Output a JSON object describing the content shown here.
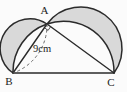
{
  "figure": {
    "labels": {
      "vertex_a": "A",
      "vertex_b": "B",
      "vertex_c": "C",
      "measurement": "9cm"
    },
    "colors": {
      "background": "#fbfbfb",
      "line": "#2b2b2b",
      "shade": "#d9d9d9",
      "dashed_line": "#5a5a5a"
    }
  }
}
